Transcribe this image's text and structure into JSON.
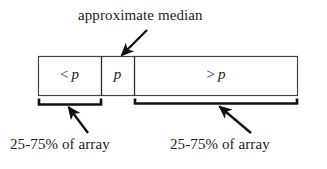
{
  "diagram": {
    "title": "approximate median",
    "partition": {
      "cells": [
        {
          "name": "less-than-pivot",
          "operator": "<",
          "variable": "p"
        },
        {
          "name": "pivot",
          "operator": "",
          "variable": "p"
        },
        {
          "name": "greater-than-pivot",
          "operator": ">",
          "variable": "p"
        }
      ]
    },
    "captions": {
      "left": "25-75% of array",
      "right": "25-75% of array"
    },
    "colors": {
      "background": "#ffffff",
      "stroke": "#1c1c1c",
      "box_border": "#444444",
      "text": "#1c1c1c"
    },
    "annotations": {
      "median_arrow": "arrow pointing down-left to pivot cell",
      "left_brace": "brace under less-than-pivot cell",
      "right_brace": "brace under greater-than-pivot cell",
      "left_caption_arrow": "arrow pointing up-left to left brace",
      "right_caption_arrow": "arrow pointing up-left to right brace"
    }
  }
}
